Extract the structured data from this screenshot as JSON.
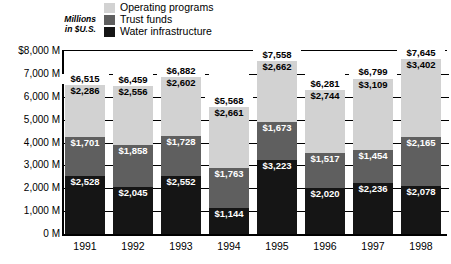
{
  "axis_title": {
    "line1": "Millions",
    "line2": "in $U.S."
  },
  "legend": {
    "items": [
      {
        "label": "Operating programs",
        "color": "#d2d2d2",
        "key": "operating"
      },
      {
        "label": "Trust funds",
        "color": "#5f5f5f",
        "key": "trust"
      },
      {
        "label": "Water infrastructure",
        "color": "#151515",
        "key": "water"
      }
    ]
  },
  "chart_data": {
    "type": "bar",
    "stacked": true,
    "title": "",
    "subtitle": "",
    "xlabel": "",
    "ylabel": "Millions in $U.S.",
    "ylim": [
      0,
      8000
    ],
    "ytick_labels": [
      "$8,000 M",
      "7,000 M",
      "6,000 M",
      "5,000 M",
      "4,000 M",
      "3,000 M",
      "2,000 M",
      "1,000 M",
      "0 M"
    ],
    "ytick_values": [
      8000,
      7000,
      6000,
      5000,
      4000,
      3000,
      2000,
      1000,
      0
    ],
    "grid": true,
    "legend_position": "top",
    "categories": [
      "1991",
      "1992",
      "1993",
      "1994",
      "1995",
      "1996",
      "1997",
      "1998"
    ],
    "series": [
      {
        "name": "Water infrastructure",
        "color": "#151515",
        "values": [
          2528,
          2045,
          2552,
          1144,
          3223,
          2020,
          2236,
          2078
        ],
        "labels": [
          "$2,528",
          "$2,045",
          "$2,552",
          "$1,144",
          "$3,223",
          "$2,020",
          "$2,236",
          "$2,078"
        ]
      },
      {
        "name": "Trust funds",
        "color": "#5f5f5f",
        "values": [
          1701,
          1858,
          1728,
          1763,
          1673,
          1517,
          1454,
          2165
        ],
        "labels": [
          "$1,701",
          "$1,858",
          "$1,728",
          "$1,763",
          "$1,673",
          "$1,517",
          "$1,454",
          "$2,165"
        ]
      },
      {
        "name": "Operating programs",
        "color": "#d2d2d2",
        "values": [
          2286,
          2556,
          2602,
          2661,
          2662,
          2744,
          3109,
          3402
        ],
        "labels": [
          "$2,286",
          "$2,556",
          "$2,602",
          "$2,661",
          "$2,662",
          "$2,744",
          "$3,109",
          "$3,402"
        ]
      }
    ],
    "totals": [
      6515,
      6459,
      6882,
      5568,
      7558,
      6281,
      6799,
      7645
    ],
    "total_labels": [
      "$6,515",
      "$6,459",
      "$6,882",
      "$5,568",
      "$7,558",
      "$6,281",
      "$6,799",
      "$7,645"
    ]
  }
}
